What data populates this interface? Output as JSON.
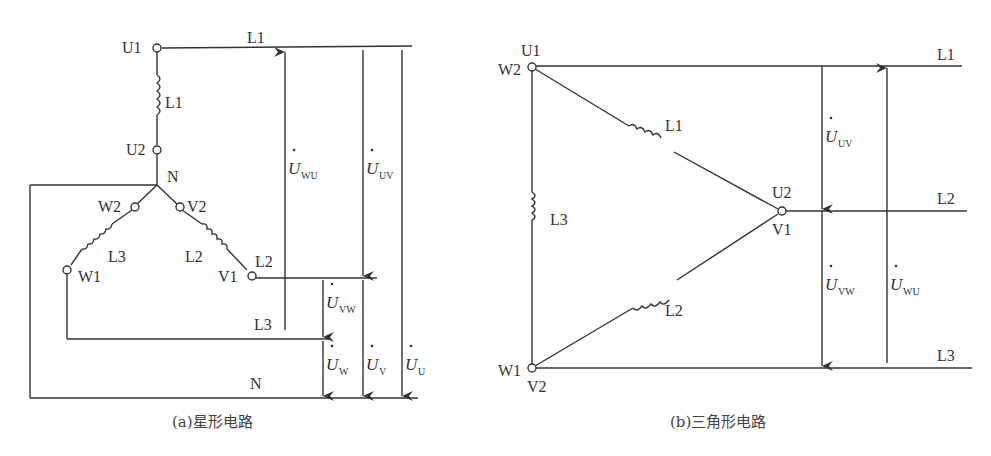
{
  "top_text_partial": "（文字被裁切，仅可见下半部分）",
  "star": {
    "caption": "(a)星形电路",
    "terminals": {
      "U1": "U1",
      "U2": "U2",
      "V1": "V1",
      "V2": "V2",
      "W1": "W1",
      "W2": "W2",
      "N": "N"
    },
    "coils": {
      "L1": "L1",
      "L2": "L2",
      "L3": "L3"
    },
    "lines": {
      "L1": "L1",
      "L2": "L2",
      "L3": "L3",
      "N": "N"
    },
    "voltages": {
      "wu": {
        "main": "U",
        "sub": "WU"
      },
      "uv": {
        "main": "U",
        "sub": "UV"
      },
      "vw": {
        "main": "U",
        "sub": "VW"
      },
      "w": {
        "main": "U",
        "sub": "W"
      },
      "v": {
        "main": "U",
        "sub": "V"
      },
      "u": {
        "main": "U",
        "sub": "U"
      }
    }
  },
  "delta": {
    "caption": "(b)三角形电路",
    "terminals": {
      "U1": "U1",
      "W2": "W2",
      "U2": "U2",
      "V1": "V1",
      "W1": "W1",
      "V2": "V2"
    },
    "coils": {
      "L1": "L1",
      "L2": "L2",
      "L3": "L3"
    },
    "lines": {
      "L1": "L1",
      "L2": "L2",
      "L3": "L3"
    },
    "voltages": {
      "uv": {
        "main": "U",
        "sub": "UV"
      },
      "vw": {
        "main": "U",
        "sub": "VW"
      },
      "wu": {
        "main": "U",
        "sub": "WU"
      }
    }
  }
}
